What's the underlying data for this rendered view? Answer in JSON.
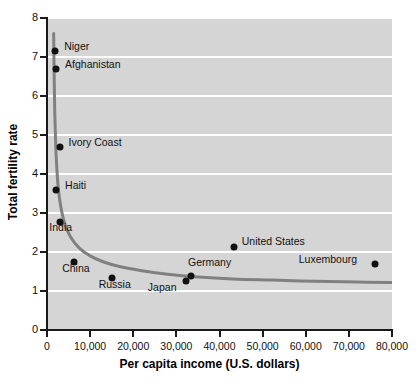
{
  "chart_data": {
    "type": "scatter",
    "title": "",
    "xlabel": "Per capita income (U.S. dollars)",
    "ylabel": "Total fertility rate",
    "xlim": [
      0,
      80000
    ],
    "ylim": [
      0,
      8
    ],
    "grid": true,
    "legend_position": "none",
    "background_color": "#d5d5d5",
    "gridline_color": "#ffffff",
    "point_color": "#111111",
    "trend_color": "#808080",
    "xticks": [
      {
        "value": 0,
        "label": "0"
      },
      {
        "value": 10000,
        "label": "10,000"
      },
      {
        "value": 20000,
        "label": "20,000"
      },
      {
        "value": 30000,
        "label": "30,000"
      },
      {
        "value": 40000,
        "label": "40,000"
      },
      {
        "value": 50000,
        "label": "50,000"
      },
      {
        "value": 60000,
        "label": "60,000"
      },
      {
        "value": 70000,
        "label": "70,000"
      },
      {
        "value": 80000,
        "label": "80,000"
      }
    ],
    "yticks": [
      {
        "value": 0,
        "label": "0"
      },
      {
        "value": 1,
        "label": "1"
      },
      {
        "value": 2,
        "label": "2"
      },
      {
        "value": 3,
        "label": "3"
      },
      {
        "value": 4,
        "label": "4"
      },
      {
        "value": 5,
        "label": "5"
      },
      {
        "value": 6,
        "label": "6"
      },
      {
        "value": 7,
        "label": "7"
      },
      {
        "value": 8,
        "label": "8"
      }
    ],
    "points": [
      {
        "label": "Niger",
        "x": 1900,
        "y": 7.15,
        "label_dx": 9,
        "label_dy": -5
      },
      {
        "label": "Afghanistan",
        "x": 2100,
        "y": 6.7,
        "label_dx": 9,
        "label_dy": -5
      },
      {
        "label": "Ivory Coast",
        "x": 2900,
        "y": 4.68,
        "label_dx": 9,
        "label_dy": -5
      },
      {
        "label": "Haiti",
        "x": 2100,
        "y": 3.6,
        "label_dx": 9,
        "label_dy": -5
      },
      {
        "label": "India",
        "x": 3100,
        "y": 2.78,
        "label_dx": -11,
        "label_dy": 5
      },
      {
        "label": "China",
        "x": 6300,
        "y": 1.75,
        "label_dx": -12,
        "label_dy": 6
      },
      {
        "label": "Russia",
        "x": 15000,
        "y": 1.34,
        "label_dx": -13,
        "label_dy": 6
      },
      {
        "label": "Japan",
        "x": 32200,
        "y": 1.25,
        "label_dx": -38,
        "label_dy": 6
      },
      {
        "label": "Germany",
        "x": 33400,
        "y": 1.38,
        "label_dx": -3,
        "label_dy": -14
      },
      {
        "label": "United States",
        "x": 43300,
        "y": 2.12,
        "label_dx": 8,
        "label_dy": -6
      },
      {
        "label": "Luxembourg",
        "x": 76000,
        "y": 1.68,
        "label_dx": -76,
        "label_dy": -5
      }
    ],
    "trend_curve": {
      "description": "Declining hyperbolic fit of fertility rate vs per capita income",
      "points": [
        {
          "x": 1550,
          "y": 7.6
        },
        {
          "x": 1650,
          "y": 6.6
        },
        {
          "x": 1800,
          "y": 5.6
        },
        {
          "x": 2000,
          "y": 4.8
        },
        {
          "x": 2300,
          "y": 4.1
        },
        {
          "x": 2700,
          "y": 3.55
        },
        {
          "x": 3300,
          "y": 3.1
        },
        {
          "x": 4200,
          "y": 2.7
        },
        {
          "x": 5500,
          "y": 2.38
        },
        {
          "x": 7500,
          "y": 2.1
        },
        {
          "x": 10000,
          "y": 1.9
        },
        {
          "x": 13000,
          "y": 1.75
        },
        {
          "x": 17000,
          "y": 1.62
        },
        {
          "x": 22000,
          "y": 1.52
        },
        {
          "x": 28000,
          "y": 1.43
        },
        {
          "x": 35000,
          "y": 1.36
        },
        {
          "x": 43000,
          "y": 1.31
        },
        {
          "x": 52000,
          "y": 1.28
        },
        {
          "x": 62000,
          "y": 1.25
        },
        {
          "x": 72000,
          "y": 1.23
        },
        {
          "x": 80000,
          "y": 1.22
        }
      ]
    }
  }
}
